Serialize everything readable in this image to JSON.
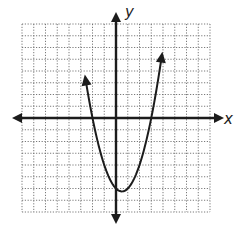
{
  "chart_data": {
    "type": "line",
    "title": "",
    "xlabel": "x",
    "ylabel": "y",
    "xlim": [
      -8,
      8
    ],
    "ylim": [
      -8,
      8
    ],
    "grid": true,
    "grid_style": "dotted",
    "axis_arrows": true,
    "tick_labels": false,
    "legend": null,
    "series": [
      {
        "name": "parabola",
        "equation": "y = x^2 - x - 6",
        "shape": "upward-opening parabola",
        "vertex": [
          0.5,
          -6.25
        ],
        "x_intercepts": [
          -2,
          3
        ],
        "y_intercept": -6,
        "arrow_ends": [
          [
            -2.6,
            5.4
          ],
          [
            3.9,
            5.3
          ]
        ],
        "x": [
          -2.6,
          -2.0,
          -1.5,
          -1.0,
          -0.5,
          0.0,
          0.5,
          1.0,
          1.5,
          2.0,
          2.5,
          3.0,
          3.5,
          3.9
        ],
        "y": [
          3.36,
          0.0,
          -2.25,
          -4.0,
          -5.25,
          -6.0,
          -6.25,
          -6.0,
          -5.25,
          -4.0,
          -2.25,
          0.0,
          2.75,
          5.31
        ]
      }
    ]
  },
  "labels": {
    "x_axis": "x",
    "y_axis": "y"
  },
  "colors": {
    "ink": "#1c1c1c",
    "grid": "#6b6b6b",
    "background": "#ffffff"
  }
}
